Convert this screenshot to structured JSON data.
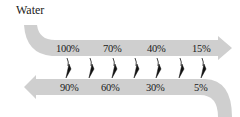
{
  "title": "Water",
  "colors": {
    "band": "#cfcfcf",
    "arrow": "#111111",
    "text": "#1a1a1a"
  },
  "top_band": {
    "direction": "right",
    "labels": [
      "100%",
      "70%",
      "40%",
      "15%"
    ]
  },
  "bottom_band": {
    "direction": "left",
    "labels": [
      "90%",
      "60%",
      "30%",
      "5%"
    ]
  },
  "transfer_arrows": {
    "count": 7,
    "direction": "down"
  }
}
